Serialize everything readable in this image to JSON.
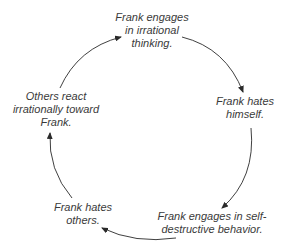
{
  "diagram": {
    "type": "cycle",
    "nodes": [
      {
        "id": "irrational-thinking",
        "lines": [
          "Frank engages",
          "in irrational",
          "thinking."
        ]
      },
      {
        "id": "hates-himself",
        "lines": [
          "Frank hates",
          "himself."
        ]
      },
      {
        "id": "self-destructive",
        "lines": [
          "Frank engages in self-",
          "destructive behavior."
        ]
      },
      {
        "id": "hates-others",
        "lines": [
          "Frank hates",
          "others."
        ]
      },
      {
        "id": "others-react",
        "lines": [
          "Others react",
          "irrationally toward",
          "Frank."
        ]
      }
    ],
    "edges": [
      {
        "from": "others-react",
        "to": "irrational-thinking"
      },
      {
        "from": "irrational-thinking",
        "to": "hates-himself"
      },
      {
        "from": "hates-himself",
        "to": "self-destructive"
      },
      {
        "from": "self-destructive",
        "to": "hates-others"
      },
      {
        "from": "hates-others",
        "to": "others-react"
      }
    ],
    "colors": {
      "text": "#3a3a3a",
      "arrow": "#2a2a2a",
      "background": "#ffffff"
    }
  }
}
